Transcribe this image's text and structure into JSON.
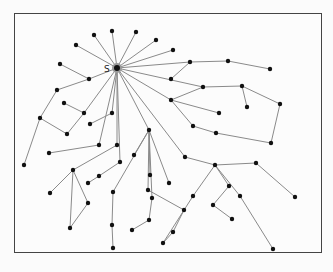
{
  "diagram": {
    "type": "tree-graph",
    "source_label": "S",
    "colors": {
      "edge": "#8a8a8a",
      "node": "#111111",
      "frame": "#444444",
      "background": "#fcfcfc"
    },
    "nodes": [
      {
        "id": "S",
        "x": 117,
        "y": 68,
        "hub": true
      },
      {
        "id": "n1",
        "x": 94,
        "y": 35
      },
      {
        "id": "n2",
        "x": 112,
        "y": 31
      },
      {
        "id": "n3",
        "x": 136,
        "y": 32
      },
      {
        "id": "n4",
        "x": 156,
        "y": 40
      },
      {
        "id": "n5",
        "x": 173,
        "y": 50
      },
      {
        "id": "n6",
        "x": 76,
        "y": 45
      },
      {
        "id": "n7",
        "x": 60,
        "y": 64
      },
      {
        "id": "n8",
        "x": 89,
        "y": 79
      },
      {
        "id": "n9",
        "x": 57,
        "y": 90
      },
      {
        "id": "n10",
        "x": 190,
        "y": 62
      },
      {
        "id": "n11",
        "x": 228,
        "y": 61
      },
      {
        "id": "n12",
        "x": 270,
        "y": 69
      },
      {
        "id": "n13",
        "x": 171,
        "y": 79
      },
      {
        "id": "n14",
        "x": 203,
        "y": 87
      },
      {
        "id": "n15",
        "x": 242,
        "y": 86
      },
      {
        "id": "n16",
        "x": 247,
        "y": 107
      },
      {
        "id": "n17",
        "x": 171,
        "y": 100
      },
      {
        "id": "n18",
        "x": 219,
        "y": 113
      },
      {
        "id": "n19",
        "x": 280,
        "y": 104
      },
      {
        "id": "n20",
        "x": 64,
        "y": 103
      },
      {
        "id": "n21",
        "x": 84,
        "y": 113
      },
      {
        "id": "n22",
        "x": 40,
        "y": 118
      },
      {
        "id": "n23",
        "x": 67,
        "y": 134
      },
      {
        "id": "n24",
        "x": 49,
        "y": 153
      },
      {
        "id": "n25",
        "x": 112,
        "y": 113
      },
      {
        "id": "n26",
        "x": 90,
        "y": 124
      },
      {
        "id": "n27",
        "x": 149,
        "y": 130
      },
      {
        "id": "n28",
        "x": 193,
        "y": 126
      },
      {
        "id": "n29",
        "x": 216,
        "y": 133
      },
      {
        "id": "n30",
        "x": 271,
        "y": 143
      },
      {
        "id": "n31",
        "x": 99,
        "y": 145
      },
      {
        "id": "n32",
        "x": 117,
        "y": 145
      },
      {
        "id": "n33",
        "x": 120,
        "y": 162
      },
      {
        "id": "n34",
        "x": 134,
        "y": 155
      },
      {
        "id": "n35",
        "x": 185,
        "y": 157
      },
      {
        "id": "n36",
        "x": 215,
        "y": 165
      },
      {
        "id": "n37",
        "x": 256,
        "y": 163
      },
      {
        "id": "n38",
        "x": 24,
        "y": 165
      },
      {
        "id": "n39",
        "x": 73,
        "y": 170
      },
      {
        "id": "n40",
        "x": 88,
        "y": 183
      },
      {
        "id": "n41",
        "x": 99,
        "y": 176
      },
      {
        "id": "n42",
        "x": 150,
        "y": 175
      },
      {
        "id": "n43",
        "x": 169,
        "y": 183
      },
      {
        "id": "n44",
        "x": 148,
        "y": 190
      },
      {
        "id": "n45",
        "x": 113,
        "y": 192
      },
      {
        "id": "n46",
        "x": 152,
        "y": 198
      },
      {
        "id": "n47",
        "x": 229,
        "y": 186
      },
      {
        "id": "n48",
        "x": 193,
        "y": 196
      },
      {
        "id": "n49",
        "x": 240,
        "y": 196
      },
      {
        "id": "n50",
        "x": 50,
        "y": 193
      },
      {
        "id": "n51",
        "x": 88,
        "y": 203
      },
      {
        "id": "n52",
        "x": 112,
        "y": 225
      },
      {
        "id": "n53",
        "x": 149,
        "y": 220
      },
      {
        "id": "n54",
        "x": 132,
        "y": 230
      },
      {
        "id": "n55",
        "x": 213,
        "y": 205
      },
      {
        "id": "n56",
        "x": 184,
        "y": 210
      },
      {
        "id": "n57",
        "x": 232,
        "y": 219
      },
      {
        "id": "n58",
        "x": 70,
        "y": 228
      },
      {
        "id": "n59",
        "x": 163,
        "y": 243
      },
      {
        "id": "n60",
        "x": 173,
        "y": 232
      },
      {
        "id": "n61",
        "x": 113,
        "y": 248
      },
      {
        "id": "n62",
        "x": 273,
        "y": 249
      },
      {
        "id": "n63",
        "x": 295,
        "y": 197
      }
    ],
    "edges": [
      [
        "S",
        "n1"
      ],
      [
        "S",
        "n2"
      ],
      [
        "S",
        "n3"
      ],
      [
        "S",
        "n4"
      ],
      [
        "S",
        "n5"
      ],
      [
        "S",
        "n6"
      ],
      [
        "S",
        "n8"
      ],
      [
        "n8",
        "n7"
      ],
      [
        "n8",
        "n9"
      ],
      [
        "S",
        "n10"
      ],
      [
        "n10",
        "n11"
      ],
      [
        "n11",
        "n12"
      ],
      [
        "n10",
        "n13"
      ],
      [
        "S",
        "n14"
      ],
      [
        "S",
        "n17"
      ],
      [
        "S",
        "n21"
      ],
      [
        "n21",
        "n20"
      ],
      [
        "n21",
        "n23"
      ],
      [
        "S",
        "n25"
      ],
      [
        "n25",
        "n26"
      ],
      [
        "S",
        "n27"
      ],
      [
        "S",
        "n31"
      ],
      [
        "n31",
        "n24"
      ],
      [
        "S",
        "n32"
      ],
      [
        "S",
        "n33"
      ],
      [
        "S",
        "n35"
      ],
      [
        "n9",
        "n22"
      ],
      [
        "n22",
        "n38"
      ],
      [
        "n22",
        "n23"
      ],
      [
        "n17",
        "n14"
      ],
      [
        "n17",
        "n18"
      ],
      [
        "n17",
        "n28"
      ],
      [
        "n14",
        "n15"
      ],
      [
        "n15",
        "n16"
      ],
      [
        "n15",
        "n19"
      ],
      [
        "n19",
        "n30"
      ],
      [
        "n28",
        "n29"
      ],
      [
        "n29",
        "n30"
      ],
      [
        "n27",
        "n34"
      ],
      [
        "n27",
        "n42"
      ],
      [
        "n27",
        "n43"
      ],
      [
        "n27",
        "n44"
      ],
      [
        "n27",
        "n45"
      ],
      [
        "n27",
        "n46"
      ],
      [
        "n35",
        "n36"
      ],
      [
        "n36",
        "n37"
      ],
      [
        "n36",
        "n47"
      ],
      [
        "n36",
        "n48"
      ],
      [
        "n36",
        "n49"
      ],
      [
        "n47",
        "n55"
      ],
      [
        "n55",
        "n57"
      ],
      [
        "n37",
        "n63"
      ],
      [
        "n49",
        "n62"
      ],
      [
        "n33",
        "n41"
      ],
      [
        "n41",
        "n40"
      ],
      [
        "n39",
        "n50"
      ],
      [
        "n39",
        "n51"
      ],
      [
        "n39",
        "n58"
      ],
      [
        "n51",
        "n58"
      ],
      [
        "n32",
        "n39"
      ],
      [
        "n45",
        "n52"
      ],
      [
        "n46",
        "n53"
      ],
      [
        "n53",
        "n54"
      ],
      [
        "n44",
        "n56"
      ],
      [
        "n56",
        "n60"
      ],
      [
        "n60",
        "n59"
      ],
      [
        "n48",
        "n59"
      ],
      [
        "n52",
        "n61"
      ]
    ]
  }
}
